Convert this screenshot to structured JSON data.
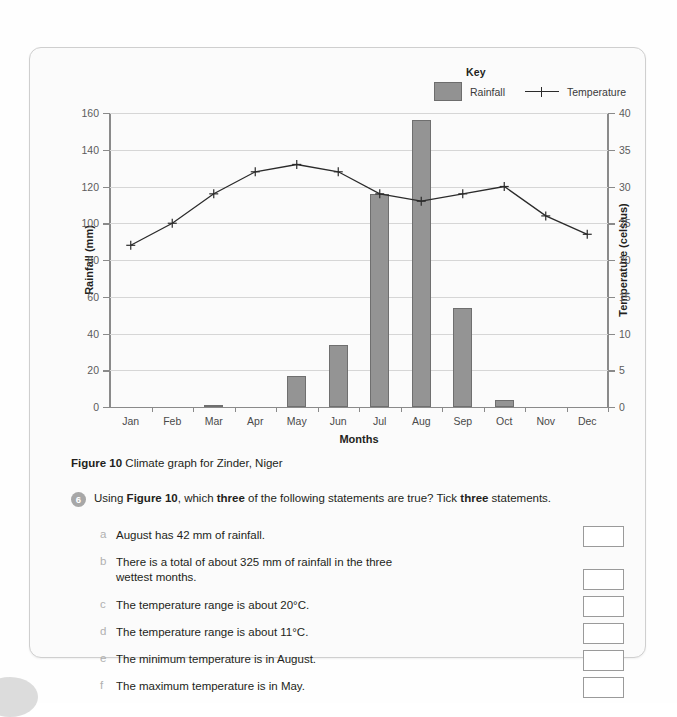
{
  "chart_data": {
    "type": "bar",
    "title": "",
    "xlabel": "Months",
    "categories": [
      "Jan",
      "Feb",
      "Mar",
      "Apr",
      "May",
      "Jun",
      "Jul",
      "Aug",
      "Sep",
      "Oct",
      "Nov",
      "Dec"
    ],
    "grid": true,
    "legend": {
      "title": "Key",
      "entries": [
        {
          "name": "Rainfall",
          "marker": "bar-swatch",
          "color": "#949494"
        },
        {
          "name": "Temperature",
          "marker": "line-cross",
          "color": "#2b2b2b"
        }
      ],
      "position": "top-right"
    },
    "axes": {
      "left": {
        "label": "Rainfall (mm)",
        "ticks": [
          0,
          20,
          40,
          60,
          80,
          100,
          120,
          140,
          160
        ],
        "lim": [
          0,
          160
        ]
      },
      "right": {
        "label": "Temperature (celsius)",
        "ticks": [
          0,
          5,
          10,
          15,
          20,
          25,
          30,
          35,
          40
        ],
        "lim": [
          0,
          40
        ]
      }
    },
    "series": [
      {
        "name": "Rainfall",
        "type": "bar",
        "axis": "left",
        "unit": "mm",
        "values": [
          0,
          0,
          1,
          0,
          17,
          34,
          116,
          156,
          54,
          4,
          0,
          0
        ]
      },
      {
        "name": "Temperature",
        "type": "line",
        "axis": "right",
        "unit": "celsius",
        "values": [
          22,
          25,
          29,
          32,
          33,
          32,
          29,
          28,
          29,
          30,
          26,
          23.5
        ]
      }
    ]
  },
  "caption": {
    "figure_label": "Figure 10",
    "text": " Climate graph for Zinder, Niger"
  },
  "question": {
    "number": "6",
    "prefix": "Using ",
    "figure_ref": "Figure 10",
    "middle": ", which ",
    "emphasis_one": "three",
    "middle_two": " of the following statements are true? Tick ",
    "emphasis_two": "three",
    "suffix": " statements.",
    "statements": [
      {
        "letter": "a",
        "text": "August has 42 mm of rainfall."
      },
      {
        "letter": "b",
        "text": "There is a total of about 325  mm of rainfall in the three wettest months."
      },
      {
        "letter": "c",
        "text": "The temperature range is about 20°C."
      },
      {
        "letter": "d",
        "text": "The temperature range is about 11°C."
      },
      {
        "letter": "e",
        "text": "The minimum temperature is in August."
      },
      {
        "letter": "f",
        "text": "The maximum temperature is in May."
      }
    ]
  },
  "colors": {
    "bar_fill": "#949494",
    "bar_stroke": "#6f6f6f",
    "line": "#2b2b2b",
    "grid": "#d6d6d6",
    "axis": "#8a8a8a",
    "card_border": "#cfcfcf",
    "badge": "#a7a7a7"
  }
}
